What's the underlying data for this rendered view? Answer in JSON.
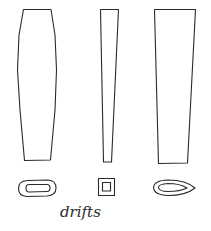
{
  "diagram": {
    "subject": "drifts",
    "caption": "drifts",
    "ink_color": "#2a2a2a",
    "background_color": "#ffffff",
    "tools": [
      {
        "id": "oval-drift",
        "profile": "barrel-shaped, widest in the middle, tapering to both ends",
        "cross_section": "oval / rounded rectangle"
      },
      {
        "id": "square-drift",
        "profile": "narrow taper",
        "cross_section": "square"
      },
      {
        "id": "teardrop-drift",
        "profile": "wide taper",
        "cross_section": "teardrop"
      }
    ]
  }
}
